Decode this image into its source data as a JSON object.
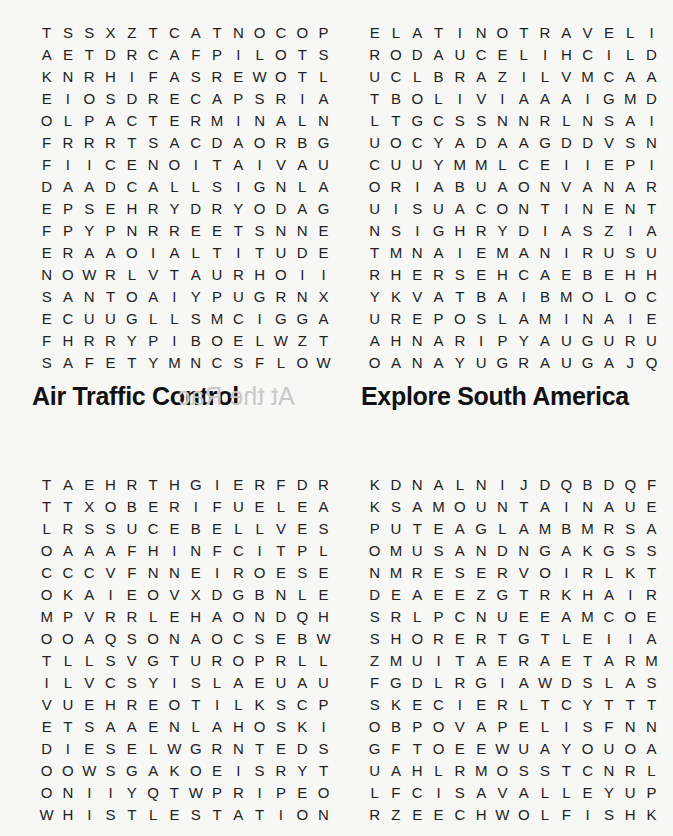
{
  "puzzles": [
    {
      "title": "Air Traffic Control",
      "cols": 14,
      "rows": [
        "TSSXZTCATNOCOP",
        "AETDRCAFPILOTS",
        "KNRHIFASREWOTL",
        "EIOSDRECAPSRIA",
        "OLPACTERMINALN",
        "FRRRTSACDAORBG",
        "FIICENOITAIVAU",
        "DAADCALLSIGNLA",
        "EPSEHRYDRYODAG",
        "FPYPNRREETSNNE",
        "ERAAOIALTITUDE",
        "NOWRLVTAURHOII",
        "SANTOAIYPUGRNX",
        "ECUUGLLSMCIGGA",
        "FHRRYPIBOELWZT",
        "SAFETYMNCSFLOW"
      ]
    },
    {
      "title": "Explore South America",
      "cols": 14,
      "rows": [
        "ELATINOTRAVELI",
        "RODAUCELIHCILD",
        "UCLBRAZILVMCAA",
        "TBOLIVIAAAIGMD",
        "LTGCSSNNRLNSAI",
        "UOCYADAAGDDVSN",
        "CUUYMMLCEIIEPI",
        "ORIABUAONVANAR",
        "UISUACONTINENT",
        "NSIGHRYDIASZIA",
        "TMNAIEMANIRUSU",
        "RHERSEHCAEBEHH",
        "YKVATBAIBMOLOC",
        "UREPOSLAMINAIE",
        "AHNARIPYAUGURU",
        "OANAYUGRAUGAJQ"
      ]
    },
    {
      "title": "",
      "cols": 14,
      "rows": [
        "TAEHRTHGIERFDR",
        "TTXOBERIFUELEA",
        "LRSSUCEBELLVES",
        "OAAAFHINFCITPL",
        "CCCVFNNEIROESE",
        "OKAIEOVXDGBNLE",
        "MPVRRLEHAONDQH",
        "OOAQSONAOCSEBW",
        "TLLSVGTUROPRLL",
        "ILVCSYISLAEUAU",
        "VUEHREOTILKSCP",
        "ETSAAENLAHOSKI",
        "DIESELWGRNTEDS",
        "OOWSGAKOEISRYT",
        "ONIIYQTWPRIPEO",
        "WHISTLESTATION"
      ]
    },
    {
      "title": "",
      "cols": 14,
      "rows": [
        "KDNALNIJDQBDQF",
        "KSAMOUNTAINAUE",
        "PUTEAGLAMBMRSA",
        "OMUSANDNGAKGSS",
        "NMRESERVOIRLKT",
        "DEAEEZGTRKHAIR",
        "SRLPCNUEEAMCOE",
        "SHORERTGTLEIIA",
        "ZMUITAERAETARM",
        "FGDLRGIAWDSLAS",
        "SKECIERLTCYTTT",
        "OBPOVAPELISFNN",
        "GFTOEEWUAYOUOA",
        "UAHLRMOSSTCNRL",
        "LFCISAVALLEYUP",
        "RZEECHWOLFISHK"
      ]
    }
  ],
  "bleed_through": {
    "left": "At the Rac",
    "right": "Airl"
  }
}
